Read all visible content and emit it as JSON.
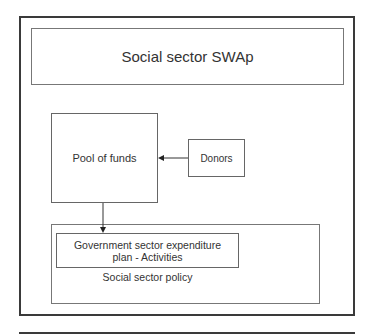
{
  "diagram": {
    "title": "Social sector SWAp",
    "nodes": {
      "pool": "Pool of funds",
      "donors": "Donors",
      "gov_line1": "Government sector expenditure",
      "gov_line2": "plan - Activities",
      "policy": "Social sector policy"
    },
    "edges": [
      {
        "from": "Donors",
        "to": "Pool of funds"
      },
      {
        "from": "Pool of funds",
        "to": "Government sector expenditure plan - Activities"
      }
    ],
    "colors": {
      "border": "#3a3a3a",
      "text": "#333333",
      "background": "#ffffff"
    }
  }
}
